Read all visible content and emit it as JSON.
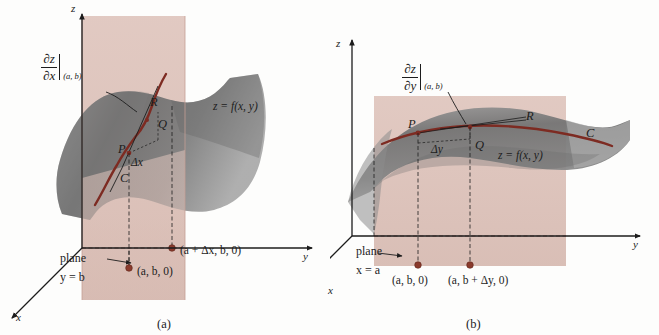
{
  "figure": {
    "background_color": "#fdfdfc"
  },
  "colors": {
    "plane_fill": "#dcc0b8",
    "plane_stroke": "#c9a79d",
    "surface_dark": "#6e6e6e",
    "surface_mid": "#8a8a8a",
    "surface_light": "#b4b4b4",
    "curve": "#7d2b22",
    "point_dot": "#8a3a2c",
    "axis": "#1c1c1c",
    "text": "#1c1c1c"
  },
  "panels": [
    {
      "id": "a",
      "caption": "(a)",
      "axes": {
        "z_label": "z",
        "y_label": "y",
        "x_label": "x"
      },
      "partial_derivative": {
        "numerator": "∂z",
        "denominator": "∂x",
        "subscript": "(a, b)"
      },
      "surface_label": "z = f(x, y)",
      "curve_label": "C",
      "points": {
        "P": "P",
        "Q": "Q",
        "R": "R"
      },
      "increment_label": "Δx",
      "plane_label_line1": "plane",
      "plane_label_line2": "y = b",
      "base_points": [
        {
          "label": "(a, b, 0)"
        },
        {
          "label": "(a + Δx, b, 0)"
        }
      ]
    },
    {
      "id": "b",
      "caption": "(b)",
      "axes": {
        "z_label": "z",
        "y_label": "y",
        "x_label": "x"
      },
      "partial_derivative": {
        "numerator": "∂z",
        "denominator": "∂y",
        "subscript": "(a, b)"
      },
      "surface_label": "z = f(x, y)",
      "curve_label": "C",
      "points": {
        "P": "P",
        "Q": "Q",
        "R": "R"
      },
      "increment_label": "Δy",
      "plane_label_line1": "plane",
      "plane_label_line2": "x = a",
      "base_points": [
        {
          "label": "(a, b, 0)"
        },
        {
          "label": "(a, b + Δy, 0)"
        }
      ]
    }
  ]
}
